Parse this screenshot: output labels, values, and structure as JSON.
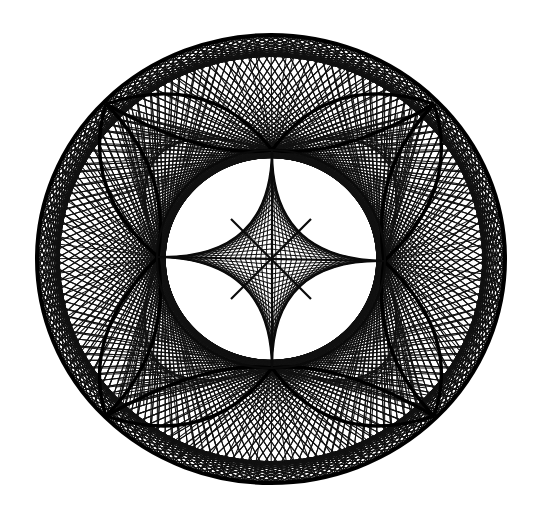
{
  "figure": {
    "background": "#ffffff",
    "ink": "#000000",
    "outer_circle": {
      "cx": 271,
      "cy": 259,
      "rx": 236,
      "ry": 226
    },
    "nodes": {
      "top": [
        272,
        150
      ],
      "right": [
        384,
        261
      ],
      "bottom": [
        272,
        368
      ],
      "left": [
        158,
        257
      ],
      "center": [
        271,
        259
      ]
    },
    "cusps": [
      [
        106,
        104
      ],
      [
        434,
        104
      ],
      [
        434,
        416
      ],
      [
        106,
        416
      ]
    ],
    "rim_points": 160,
    "chord_steps": [
      22,
      138,
      56,
      104
    ],
    "fan_count": 44
  }
}
